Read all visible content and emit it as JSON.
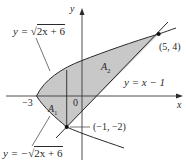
{
  "figure": {
    "axes": {
      "x_label": "x",
      "y_label": "y",
      "origin_label": "0",
      "tick_neg3_label": "−3"
    },
    "curves": {
      "upper_parabola": {
        "prefix": "y = ",
        "sqrt_sign": "√",
        "radicand": "2x + 6"
      },
      "lower_parabola": {
        "prefix": "y = −",
        "sqrt_sign": "√",
        "radicand": "2x + 6"
      },
      "line": {
        "label": "y = x − 1"
      }
    },
    "points": {
      "upper_intersection": "(5, 4)",
      "lower_intersection": "(−1, −2)"
    },
    "regions": {
      "a1": {
        "letter": "A",
        "sub": "1"
      },
      "a2": {
        "letter": "A",
        "sub": "2"
      }
    },
    "colors": {
      "fill": "#c8c8c8",
      "stroke": "#2a2a2a",
      "axis": "#3a3a3a"
    }
  }
}
